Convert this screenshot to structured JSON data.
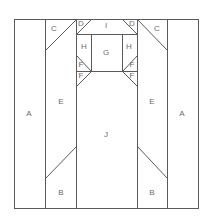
{
  "diagram": {
    "type": "quilt-block-pattern",
    "line_color": "#5a5a5a",
    "label_color": "#6a6a6a",
    "pieces": [
      {
        "id": "A_left",
        "label": "A",
        "x": 29,
        "y": 113
      },
      {
        "id": "A_right",
        "label": "A",
        "x": 182,
        "y": 113
      },
      {
        "id": "B_left",
        "label": "B",
        "x": 61,
        "y": 192
      },
      {
        "id": "B_right",
        "label": "B",
        "x": 152,
        "y": 192
      },
      {
        "id": "C_left",
        "label": "C",
        "x": 54,
        "y": 28
      },
      {
        "id": "C_right",
        "label": "C",
        "x": 157,
        "y": 28
      },
      {
        "id": "D_left",
        "label": "D",
        "x": 81,
        "y": 23
      },
      {
        "id": "D_right",
        "label": "D",
        "x": 132,
        "y": 23
      },
      {
        "id": "E_left",
        "label": "E",
        "x": 61,
        "y": 101
      },
      {
        "id": "E_right",
        "label": "E",
        "x": 152,
        "y": 101
      },
      {
        "id": "F_left_top",
        "label": "F",
        "x": 81,
        "y": 64
      },
      {
        "id": "F_left_bottom",
        "label": "F",
        "x": 81,
        "y": 75
      },
      {
        "id": "F_right_top",
        "label": "F",
        "x": 132,
        "y": 64
      },
      {
        "id": "F_right_bottom",
        "label": "F",
        "x": 132,
        "y": 75
      },
      {
        "id": "G",
        "label": "G",
        "x": 106,
        "y": 52
      },
      {
        "id": "H_left",
        "label": "H",
        "x": 84,
        "y": 46
      },
      {
        "id": "H_right",
        "label": "H",
        "x": 129,
        "y": 46
      },
      {
        "id": "I",
        "label": "I",
        "x": 106,
        "y": 25
      },
      {
        "id": "J",
        "label": "J",
        "x": 106,
        "y": 134
      }
    ]
  }
}
